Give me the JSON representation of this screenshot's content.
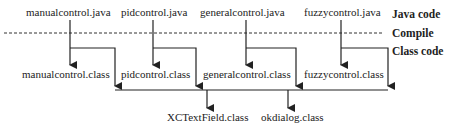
{
  "diagram": {
    "source_files": [
      {
        "label": "manualcontrol.java",
        "x": 26,
        "y": 6
      },
      {
        "label": "pidcontrol.java",
        "x": 121,
        "y": 6
      },
      {
        "label": "generalcontrol.java",
        "x": 200,
        "y": 6
      },
      {
        "label": "fuzzycontrol.java",
        "x": 304,
        "y": 6
      }
    ],
    "class_files": [
      {
        "label": "manualcontrol.class",
        "x": 22,
        "y": 68
      },
      {
        "label": "pidcontrol.class",
        "x": 121,
        "y": 68
      },
      {
        "label": "generalcontrol.class",
        "x": 203,
        "y": 68
      },
      {
        "label": "fuzzycontrol.class",
        "x": 304,
        "y": 68
      }
    ],
    "shared_classes": [
      {
        "label": "XCTextField.class",
        "x": 167,
        "y": 111
      },
      {
        "label": "okdialog.class",
        "x": 261,
        "y": 111
      }
    ],
    "stage_labels": {
      "java_code": "Java code",
      "compile": "Compile",
      "class_code": "Class code"
    },
    "colors": {
      "line": "#222222",
      "text": "#222222",
      "background": "#ffffff"
    }
  }
}
